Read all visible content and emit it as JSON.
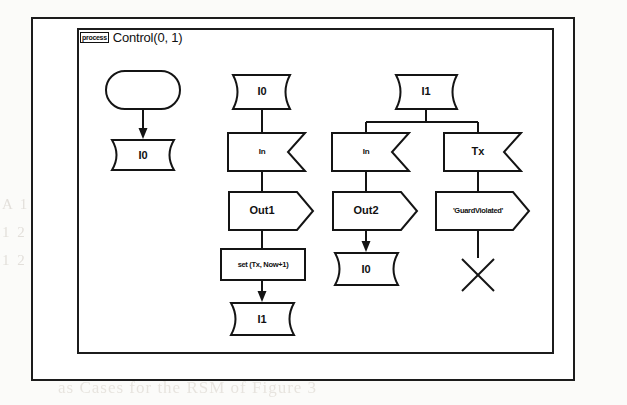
{
  "diagram": {
    "type": "sdl-process-diagram",
    "frame": {
      "keyword": "process",
      "title": "Control(0, 1)"
    },
    "columns": [
      {
        "id": "column-1",
        "nodes": [
          {
            "id": "n1-start",
            "kind": "start-symbol",
            "label": ""
          },
          {
            "id": "n1-state-i0",
            "kind": "state-symbol",
            "label": "I0"
          }
        ]
      },
      {
        "id": "column-2",
        "nodes": [
          {
            "id": "n2-state-i0",
            "kind": "state-symbol",
            "label": "I0"
          },
          {
            "id": "n2-input-in",
            "kind": "input-symbol",
            "label": "In"
          },
          {
            "id": "n2-output-out1",
            "kind": "output-symbol",
            "label": "Out1"
          },
          {
            "id": "n2-task-set",
            "kind": "task-symbol",
            "label": "set (Tx, Now+1)"
          },
          {
            "id": "n2-state-i1",
            "kind": "state-symbol",
            "label": "I1"
          }
        ]
      },
      {
        "id": "column-3",
        "nodes": [
          {
            "id": "n3-state-i1",
            "kind": "state-symbol",
            "label": "I1"
          },
          {
            "id": "n3-input-in",
            "kind": "input-symbol",
            "label": "In"
          },
          {
            "id": "n3-output-out2",
            "kind": "output-symbol",
            "label": "Out2"
          },
          {
            "id": "n3-state-i0",
            "kind": "state-symbol",
            "label": "I0"
          },
          {
            "id": "n3-input-tx",
            "kind": "input-symbol",
            "label": "Tx"
          },
          {
            "id": "n3-output-guard",
            "kind": "output-symbol",
            "label": "'GuardViolated'"
          },
          {
            "id": "n3-stop",
            "kind": "stop-symbol",
            "label": ""
          }
        ]
      }
    ]
  },
  "background_text": {
    "line1": "A 1 2 1 3 1 2 1 4 1 2 1 3 1 2 1 5",
    "line2": "1 2 1 3 1 2 1 4 1 2 1 3 1 2 1 6 1",
    "line3": "1 2 1 3 1 2 1 4 1 2 1 3 1 2 1 7 1",
    "caption": "as Cases for the RSM of Figure 3"
  },
  "colors": {
    "stroke": "#141414",
    "fill": "#ffffff",
    "page": "#fbfbf9",
    "ghost": "#cfc9c2"
  }
}
